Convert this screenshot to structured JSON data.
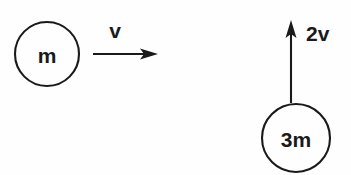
{
  "diagram": {
    "background_color": "#fefefe",
    "ink_color": "#1a1a1a",
    "width": 351,
    "height": 175,
    "bodies": [
      {
        "id": "body-m",
        "label": "m",
        "cx": 47,
        "cy": 54,
        "r": 32
      },
      {
        "id": "body-3m",
        "label": "3m",
        "cx": 296,
        "cy": 138,
        "r": 34
      }
    ],
    "vectors": [
      {
        "id": "velocity-v",
        "label": "v",
        "direction": "right",
        "x1": 93,
        "y1": 54,
        "x2": 158,
        "y2": 54,
        "label_x": 115,
        "label_y": 29
      },
      {
        "id": "velocity-2v",
        "label": "2v",
        "direction": "up",
        "x1": 291,
        "y1": 103,
        "x2": 291,
        "y2": 20,
        "label_x": 306,
        "label_y": 32
      }
    ]
  }
}
